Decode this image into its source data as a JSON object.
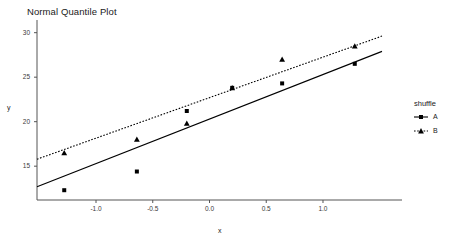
{
  "chart_data": {
    "type": "scatter",
    "title": "Normal Quantile Plot",
    "xlabel": "x",
    "ylabel": "y",
    "xlim": [
      -1.52,
      1.52
    ],
    "ylim": [
      11.2,
      31.2
    ],
    "xticks": [
      "-1.0",
      "-0.5",
      "0.0",
      "0.5",
      "1.0"
    ],
    "xtick_values": [
      -1.0,
      -0.5,
      0.0,
      0.5,
      1.0
    ],
    "yticks": [
      "15",
      "20",
      "25",
      "30"
    ],
    "ytick_values": [
      15,
      20,
      25,
      30
    ],
    "grid": false,
    "legend": {
      "title": "shuffle",
      "position": "right",
      "entries": [
        {
          "label": "A",
          "marker": "square",
          "line": "solid",
          "color": "#000000"
        },
        {
          "label": "B",
          "marker": "triangle",
          "line": "dotted",
          "color": "#000000"
        }
      ]
    },
    "series": [
      {
        "name": "A",
        "marker": "square",
        "line": "solid",
        "color": "#000000",
        "x": [
          -1.28,
          -0.64,
          -0.2,
          0.2,
          0.64,
          1.28
        ],
        "y": [
          12.3,
          14.4,
          21.2,
          23.8,
          24.3,
          26.5
        ],
        "fit_line": {
          "intercept": 20.3,
          "slope": 5.0
        }
      },
      {
        "name": "B",
        "marker": "triangle",
        "line": "dotted",
        "color": "#000000",
        "x": [
          -1.28,
          -0.64,
          -0.2,
          0.2,
          0.64,
          1.28
        ],
        "y": [
          16.5,
          18.0,
          19.8,
          23.8,
          27.0,
          28.5
        ],
        "fit_line": {
          "intercept": 22.7,
          "slope": 4.55
        }
      }
    ]
  }
}
